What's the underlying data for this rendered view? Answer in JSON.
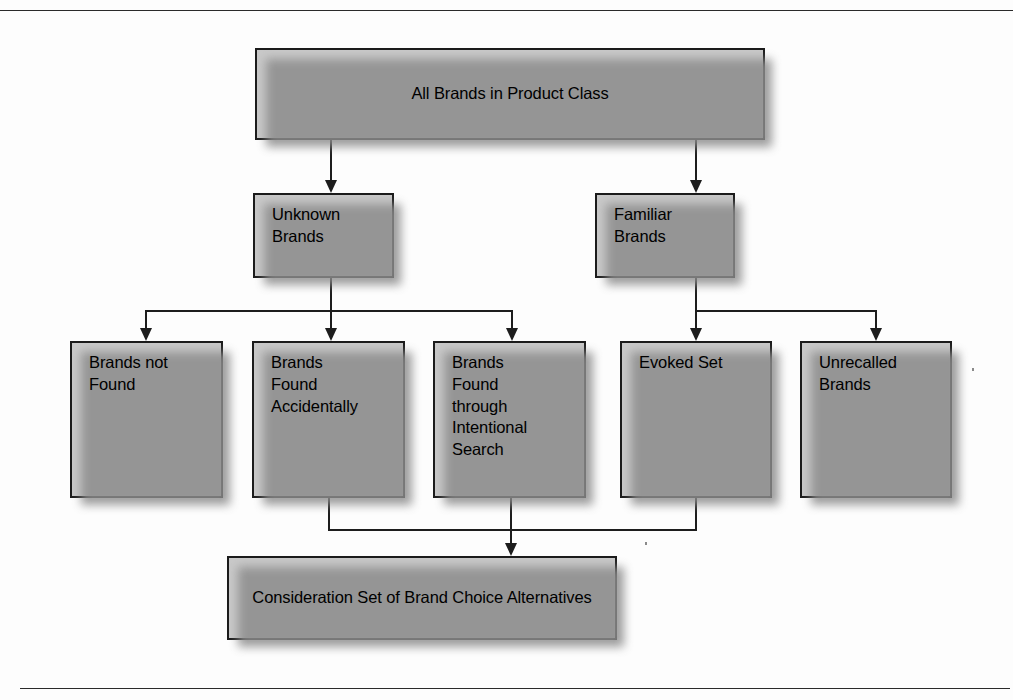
{
  "figure": {
    "type": "flowchart",
    "title_text": "",
    "orientation": "top-down",
    "colors": {
      "box_fill": "#c8c8c8",
      "box_border": "#1b1b1b",
      "connector": "#1d1d1d",
      "shadow": "#8d8d8d",
      "page_background": "#fdfdfd",
      "rule": "#2a2a2a"
    }
  },
  "nodes": {
    "root": {
      "label": "All Brands in Product Class"
    },
    "unknown_brands": {
      "label": "Unknown\nBrands"
    },
    "familiar_brands": {
      "label": "Familiar\nBrands"
    },
    "brands_not_found": {
      "label": "Brands not\nFound"
    },
    "brands_found_accidentally": {
      "label": "Brands\nFound\nAccidentally"
    },
    "brands_found_intentional": {
      "label": "Brands\nFound\nthrough\nIntentional\nSearch"
    },
    "evoked_set": {
      "label": "Evoked Set"
    },
    "unrecalled_brands": {
      "label": "Unrecalled\nBrands"
    },
    "consideration_set": {
      "label": "Consideration Set of Brand Choice Alternatives"
    }
  },
  "edges": [
    {
      "from": "root",
      "to": "unknown_brands"
    },
    {
      "from": "root",
      "to": "familiar_brands"
    },
    {
      "from": "unknown_brands",
      "to": "brands_not_found"
    },
    {
      "from": "unknown_brands",
      "to": "brands_found_accidentally"
    },
    {
      "from": "unknown_brands",
      "to": "brands_found_intentional"
    },
    {
      "from": "familiar_brands",
      "to": "evoked_set"
    },
    {
      "from": "familiar_brands",
      "to": "unrecalled_brands"
    },
    {
      "from": "brands_found_accidentally",
      "to": "consideration_set"
    },
    {
      "from": "brands_found_intentional",
      "to": "consideration_set"
    },
    {
      "from": "evoked_set",
      "to": "consideration_set"
    }
  ]
}
